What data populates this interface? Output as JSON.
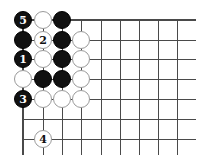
{
  "board": {
    "grid": {
      "cols_x": [
        23,
        43,
        62,
        81,
        101,
        120,
        139,
        158,
        177
      ],
      "rows_y": [
        20,
        40,
        59,
        79,
        99,
        119,
        139
      ],
      "right_edge_x": 196,
      "bottom_edge_y": 155,
      "line_color": "#4a4a4a"
    },
    "stones": [
      {
        "col": 0,
        "row": 0,
        "color": "black",
        "label": "5"
      },
      {
        "col": 1,
        "row": 0,
        "color": "white",
        "label": ""
      },
      {
        "col": 2,
        "row": 0,
        "color": "black",
        "label": ""
      },
      {
        "col": 0,
        "row": 1,
        "color": "black",
        "label": ""
      },
      {
        "col": 1,
        "row": 1,
        "color": "white",
        "label": "2"
      },
      {
        "col": 2,
        "row": 1,
        "color": "black",
        "label": ""
      },
      {
        "col": 3,
        "row": 1,
        "color": "white",
        "label": ""
      },
      {
        "col": 0,
        "row": 2,
        "color": "black",
        "label": "1"
      },
      {
        "col": 1,
        "row": 2,
        "color": "white",
        "label": ""
      },
      {
        "col": 2,
        "row": 2,
        "color": "black",
        "label": ""
      },
      {
        "col": 3,
        "row": 2,
        "color": "white",
        "label": ""
      },
      {
        "col": 0,
        "row": 3,
        "color": "white",
        "label": ""
      },
      {
        "col": 1,
        "row": 3,
        "color": "black",
        "label": ""
      },
      {
        "col": 2,
        "row": 3,
        "color": "black",
        "label": ""
      },
      {
        "col": 3,
        "row": 3,
        "color": "white",
        "label": ""
      },
      {
        "col": 0,
        "row": 4,
        "color": "black",
        "label": "3"
      },
      {
        "col": 1,
        "row": 4,
        "color": "white",
        "label": ""
      },
      {
        "col": 2,
        "row": 4,
        "color": "white",
        "label": ""
      },
      {
        "col": 3,
        "row": 4,
        "color": "white",
        "label": ""
      },
      {
        "col": 1,
        "row": 6,
        "color": "white",
        "label": "4"
      }
    ]
  }
}
